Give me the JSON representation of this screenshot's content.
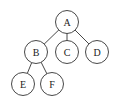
{
  "diagram": {
    "type": "tree",
    "colors": {
      "stroke": "#333333",
      "fill": "#ffffff",
      "text": "#222222"
    },
    "radius": 11.5,
    "nodes": [
      {
        "id": "A",
        "label": "A",
        "x": 67,
        "y": 22
      },
      {
        "id": "B",
        "label": "B",
        "x": 36,
        "y": 52
      },
      {
        "id": "C",
        "label": "C",
        "x": 67,
        "y": 52
      },
      {
        "id": "D",
        "label": "D",
        "x": 97,
        "y": 52
      },
      {
        "id": "E",
        "label": "E",
        "x": 23,
        "y": 84
      },
      {
        "id": "F",
        "label": "F",
        "x": 52,
        "y": 84
      }
    ],
    "edges": [
      {
        "from": "A",
        "to": "B"
      },
      {
        "from": "A",
        "to": "C"
      },
      {
        "from": "A",
        "to": "D"
      },
      {
        "from": "B",
        "to": "E"
      },
      {
        "from": "B",
        "to": "F"
      }
    ]
  }
}
